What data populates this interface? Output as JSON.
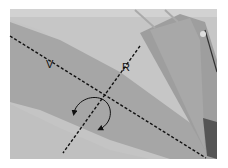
{
  "figure": {
    "labels": {
      "v_axis": "V",
      "r_axis": "R"
    },
    "colors": {
      "background": "#ffffff",
      "photo_base": "#b4b4b4",
      "upper_region": "#c8c8c8",
      "arm_band": "#a0a0a0",
      "lower_region": "#c4c4c4",
      "fan_shape": "#9a9a9a",
      "annotation": "#111111"
    },
    "icons": [
      "rotation-arrow-icon",
      "rotation-arrow-icon"
    ]
  }
}
